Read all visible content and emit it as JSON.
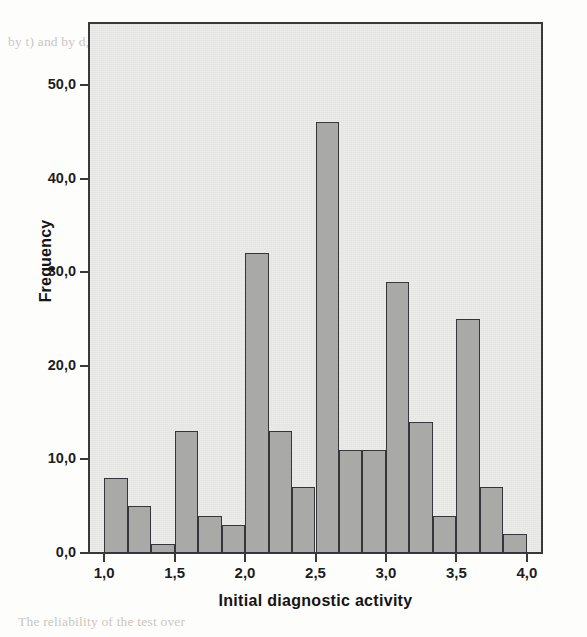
{
  "figure": {
    "panel_color": "#e9e9e7",
    "bar_fill": "#a9a9a7",
    "bar_edge": "#35353a",
    "axis_color": "#39393a"
  },
  "background_text": [
    {
      "text": "by t) and by d, and  a  and b  probability of a given to B",
      "x": 8,
      "y": 34
    },
    {
      "text": "and Psychological Assessment",
      "x": 330,
      "y": 44
    },
    {
      "text": "Psychological Assessment",
      "x": 195,
      "y": 96
    },
    {
      "text": "Criteria for validity and of the test purpose of",
      "x": 178,
      "y": 148
    },
    {
      "text": "for testing the use of it is in agreement",
      "x": 186,
      "y": 176
    },
    {
      "text": "A work of a  every  case  the  ty of each",
      "x": 174,
      "y": 203
    },
    {
      "text": "that each and more",
      "x": 240,
      "y": 230
    },
    {
      "text": "Reliability and validity of a single for the",
      "x": 188,
      "y": 280
    },
    {
      "text": "with the of the equivalent. The  Cohen's",
      "x": 184,
      "y": 305
    },
    {
      "text": "ent (ICC) and the Kappa (K) the result",
      "x": 182,
      "y": 330
    },
    {
      "text": "and the  reliability  was computed for all",
      "x": 178,
      "y": 355
    },
    {
      "text": "of a variable is clearly being",
      "x": 200,
      "y": 410
    },
    {
      "text": "true value of the  thus  the  reported by",
      "x": 192,
      "y": 434
    },
    {
      "text": "will be close to it.",
      "x": 208,
      "y": 458
    },
    {
      "text": "The reliability of the test over",
      "x": 18,
      "y": 614
    }
  ],
  "chart_data": {
    "type": "bar",
    "title": "",
    "subtitle": "",
    "xlabel": "Initial diagnostic activity",
    "ylabel": "Frequency",
    "xlim": [
      0.9,
      4.1
    ],
    "ylim": [
      0,
      56
    ],
    "grid": false,
    "legend": null,
    "bin_width": 0.1667,
    "x_ticks": [
      "1,0",
      "1,5",
      "2,0",
      "2,5",
      "3,0",
      "3,5",
      "4,0"
    ],
    "x_tick_values": [
      1.0,
      1.5,
      2.0,
      2.5,
      3.0,
      3.5,
      4.0
    ],
    "y_ticks": [
      "0,0",
      "10,0",
      "20,0",
      "30,0",
      "40,0",
      "50,0"
    ],
    "y_tick_values": [
      0,
      10,
      20,
      30,
      40,
      50
    ],
    "bins": [
      {
        "start": 1.0,
        "end": 1.1667,
        "value": 8
      },
      {
        "start": 1.1667,
        "end": 1.3333,
        "value": 5
      },
      {
        "start": 1.3333,
        "end": 1.5,
        "value": 1
      },
      {
        "start": 1.5,
        "end": 1.6667,
        "value": 13
      },
      {
        "start": 1.6667,
        "end": 1.8333,
        "value": 4
      },
      {
        "start": 1.8333,
        "end": 2.0,
        "value": 3
      },
      {
        "start": 2.0,
        "end": 2.1667,
        "value": 32
      },
      {
        "start": 2.1667,
        "end": 2.3333,
        "value": 13
      },
      {
        "start": 2.3333,
        "end": 2.5,
        "value": 7
      },
      {
        "start": 2.5,
        "end": 2.6667,
        "value": 46
      },
      {
        "start": 2.6667,
        "end": 2.8333,
        "value": 11
      },
      {
        "start": 2.8333,
        "end": 3.0,
        "value": 11
      },
      {
        "start": 3.0,
        "end": 3.1667,
        "value": 29
      },
      {
        "start": 3.1667,
        "end": 3.3333,
        "value": 14
      },
      {
        "start": 3.3333,
        "end": 3.5,
        "value": 4
      },
      {
        "start": 3.5,
        "end": 3.6667,
        "value": 25
      },
      {
        "start": 3.6667,
        "end": 3.8333,
        "value": 7
      },
      {
        "start": 3.8333,
        "end": 4.0,
        "value": 2
      }
    ]
  }
}
